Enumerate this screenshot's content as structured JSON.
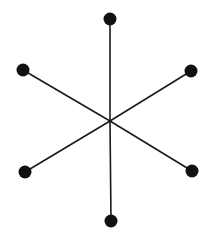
{
  "diagram": {
    "type": "star-graph",
    "background": "#ffffff",
    "edge_color": "#1a1a1a",
    "node_color": "#111111",
    "edge_width": 1.6,
    "node_radius": 6.5,
    "center": {
      "x": 110,
      "y": 121
    },
    "leaves": [
      {
        "id": "top",
        "x": 110,
        "y": 19
      },
      {
        "id": "upper-right",
        "x": 191,
        "y": 71
      },
      {
        "id": "lower-right",
        "x": 192,
        "y": 171
      },
      {
        "id": "bottom",
        "x": 111,
        "y": 221
      },
      {
        "id": "lower-left",
        "x": 25,
        "y": 172
      },
      {
        "id": "upper-left",
        "x": 23,
        "y": 70
      }
    ]
  }
}
